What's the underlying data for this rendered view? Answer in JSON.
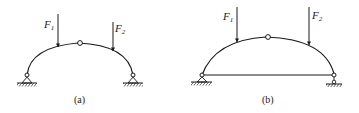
{
  "figures": [
    {
      "id": "a",
      "caption": "(a)",
      "type": "three-hinged arch",
      "loads": [
        {
          "symbol": "F",
          "subscript": "1"
        },
        {
          "symbol": "F",
          "subscript": "2"
        }
      ],
      "supports": {
        "left": "pin",
        "right": "pin"
      },
      "crown": "hinge",
      "tie": false
    },
    {
      "id": "b",
      "caption": "(b)",
      "type": "tied three-hinged arch",
      "loads": [
        {
          "symbol": "F",
          "subscript": "1"
        },
        {
          "symbol": "F",
          "subscript": "2"
        }
      ],
      "supports": {
        "left": "pin",
        "right": "roller"
      },
      "crown": "hinge",
      "tie": true
    }
  ],
  "colors": {
    "line": "#1a1a1a",
    "background": "#ffffff"
  }
}
